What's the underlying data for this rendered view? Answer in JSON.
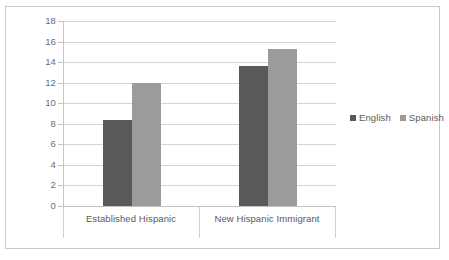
{
  "chart_data": {
    "type": "bar",
    "title": "",
    "subtitle": "",
    "xlabel": "",
    "ylabel": "",
    "categories": [
      "Established Hispanic",
      "New Hispanic Immigrant"
    ],
    "series": [
      {
        "name": "English",
        "color": "#595959",
        "values": [
          8.4,
          13.6
        ]
      },
      {
        "name": "Spanish",
        "color": "#9b9b9b",
        "values": [
          12.0,
          15.3
        ]
      }
    ],
    "ylim": [
      0,
      18
    ],
    "ytick_step": 2,
    "yticks": [
      "18",
      "16",
      "14",
      "12",
      "10",
      "8",
      "6",
      "4",
      "2",
      "0"
    ],
    "grid": true,
    "legend_position": "right",
    "legend": [
      "English",
      "Spanish"
    ],
    "frame_border": "#c9c9c9",
    "gridline_color": "#d3d3d3",
    "tick_label_color": "#6d6d6d"
  }
}
